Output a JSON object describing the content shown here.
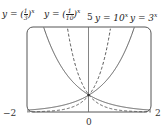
{
  "chart_data": {
    "type": "line",
    "title": "",
    "xlabel": "",
    "ylabel": "",
    "xlim": [
      -2,
      2
    ],
    "ylim": [
      0,
      5
    ],
    "tick_labels": {
      "x_left": "−2",
      "x_right": "2",
      "x_zero": "0",
      "y_top": "5"
    },
    "grid": false,
    "series": [
      {
        "name": "y = (1/3)^x",
        "style": "solid",
        "base": 0.3333
      },
      {
        "name": "y = (1/10)^x",
        "style": "dashed",
        "base": 0.1
      },
      {
        "name": "y = 10^x",
        "style": "dashed",
        "base": 10
      },
      {
        "name": "y = 3^x",
        "style": "solid",
        "base": 3
      }
    ],
    "intersection": {
      "x": 0,
      "y": 1
    }
  },
  "labels": {
    "l1_pre": "y = (",
    "l1_num": "1",
    "l1_den": "3",
    "l2_num": "1",
    "l2_den": "10",
    "exp": "x",
    "l3": "y = 10",
    "l4": "y = 3",
    "five": "5",
    "neg2": "−2",
    "pos2": "2",
    "zero": "0"
  }
}
